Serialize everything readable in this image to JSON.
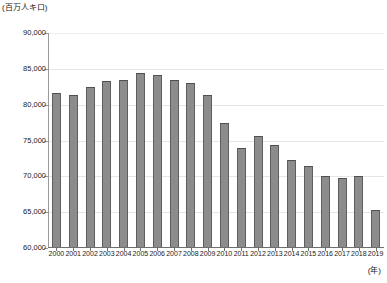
{
  "chart_data": {
    "type": "bar",
    "title": "",
    "subtitle": "",
    "xlabel": "(年)",
    "ylabel": "(百万人キロ)",
    "categories": [
      "2000",
      "2001",
      "2002",
      "2003",
      "2004",
      "2005",
      "2006",
      "2007",
      "2008",
      "2009",
      "2010",
      "2011",
      "2012",
      "2013",
      "2014",
      "2015",
      "2016",
      "2017",
      "2018",
      "2019"
    ],
    "values": [
      81600,
      81300,
      82500,
      83300,
      83500,
      84400,
      84200,
      83500,
      83000,
      81400,
      77500,
      73900,
      75600,
      74400,
      72300,
      71400,
      70100,
      69800,
      70000,
      65300
    ],
    "series": [
      {
        "name": "輸送人キロ",
        "values": [
          81600,
          81300,
          82500,
          83300,
          83500,
          84400,
          84200,
          83500,
          83000,
          81400,
          77500,
          73900,
          75600,
          74400,
          72300,
          71400,
          70100,
          69800,
          70000,
          65300
        ]
      }
    ],
    "ylim": [
      60000,
      90000
    ],
    "ytick_values": [
      60000,
      65000,
      70000,
      75000,
      80000,
      85000,
      90000
    ],
    "ytick_labels": [
      "60,000",
      "65,000",
      "70,000",
      "75,000",
      "80,000",
      "85,000",
      "90,000"
    ],
    "grid": true,
    "grid_axis": "y",
    "legend": false,
    "legend_position": "none",
    "bar_fill_color": "#8c8c8c",
    "bar_edge_color": "#4f4f4f",
    "gridline_color": "#e6e6e6",
    "axis_color": "#6e6e6e",
    "background_color": "#ffffff"
  }
}
